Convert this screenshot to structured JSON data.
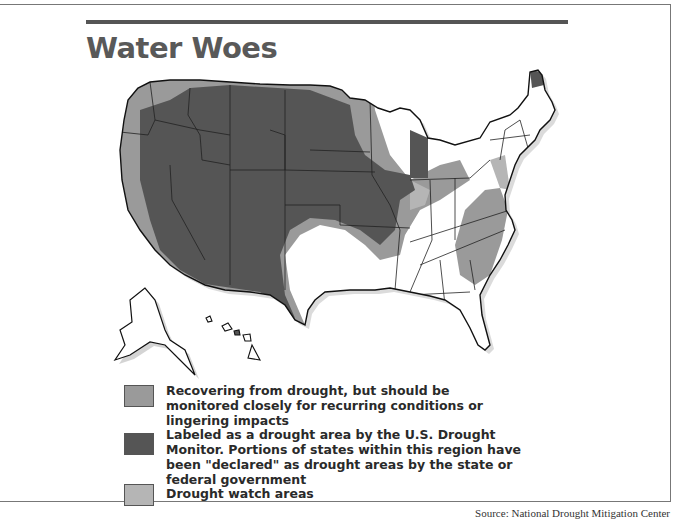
{
  "title": "Water Woes",
  "colors": {
    "recovering": "#9a9a9a",
    "drought": "#555555",
    "watch": "#b5b5b5",
    "title": "#595959",
    "rule": "#555555"
  },
  "map": {
    "subject": "United States drought conditions map",
    "regions": [
      {
        "category": "drought",
        "areas": "Most of the West and Northern Plains: Idaho, Montana, Wyoming, Nevada, Utah, Colorado, Arizona, New Mexico, Dakotas, Nebraska, Kansas, western Iowa/Missouri, Michigan, northern Maine"
      },
      {
        "category": "recovering",
        "areas": "Pacific coast (Washington, Oregon, California fringe), bands around drought core through Midwest, Ohio Valley, Southeast (Georgia, South Carolina, North Carolina)"
      },
      {
        "category": "watch",
        "areas": "Margins of drought zones, northern Minnesota/Wisconsin, Mid-Atlantic coast"
      }
    ]
  },
  "legend": {
    "items": [
      {
        "key": "recovering",
        "text": "Recovering from drought, but should be monitored closely for recurring conditions or lingering impacts"
      },
      {
        "key": "drought",
        "text": "Labeled as a drought area by the U.S. Drought Monitor. Portions of states within this region have been \"declared\" as drought areas by the state or federal government"
      },
      {
        "key": "watch",
        "text": "Drought watch areas"
      }
    ]
  },
  "source": "Source: National Drought Mitigation Center"
}
